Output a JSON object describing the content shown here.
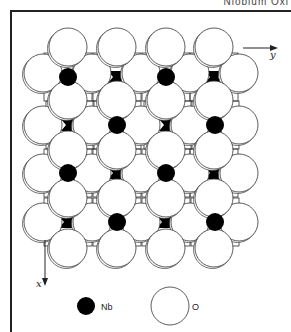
{
  "header": {
    "text": "Niobium Oxi"
  },
  "diagram": {
    "axes": {
      "x_label": "x",
      "y_label": "y"
    },
    "legend": [
      {
        "symbol": "filled-black-small-circle",
        "label": "Nb"
      },
      {
        "symbol": "open-large-circle",
        "label": "O"
      }
    ],
    "colors": {
      "nb": "#000000",
      "o_fill": "#ffffff",
      "stroke": "#333333"
    },
    "o_radius": 19,
    "nb_radius": 9,
    "o_atoms_even_rows": {
      "y": [
        47,
        100,
        150,
        198,
        248
      ],
      "x": [
        68,
        117,
        166,
        214
      ]
    },
    "o_atoms_odd_rows": {
      "y": [
        73,
        125,
        173,
        222
      ],
      "x": [
        43,
        92,
        141,
        190,
        239
      ]
    },
    "nb_round": [
      [
        68,
        77
      ],
      [
        166,
        77
      ],
      [
        117,
        125
      ],
      [
        215,
        125
      ],
      [
        68,
        173
      ],
      [
        166,
        173
      ],
      [
        117,
        222
      ],
      [
        215,
        222
      ]
    ],
    "nb_bowtie": [
      [
        117,
        77
      ],
      [
        214,
        77
      ],
      [
        70,
        125
      ],
      [
        168,
        125
      ],
      [
        117,
        173
      ],
      [
        214,
        173
      ],
      [
        68,
        222
      ],
      [
        166,
        222
      ]
    ]
  }
}
